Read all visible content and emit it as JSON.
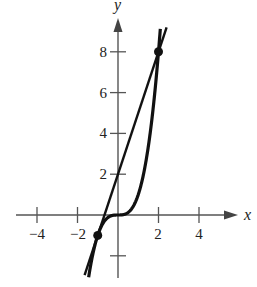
{
  "chart_data": {
    "type": "line",
    "title": "",
    "xlabel": "x",
    "ylabel": "y",
    "xlim": [
      -5,
      5.8
    ],
    "ylim": [
      -3.5,
      10.5
    ],
    "x_ticks": [
      -4,
      -2,
      2,
      4
    ],
    "x_tick_labels": [
      "−4",
      "−2",
      "2",
      "4"
    ],
    "y_ticks": [
      -2,
      2,
      4,
      6,
      8
    ],
    "y_tick_labels": [
      "",
      "2",
      "4",
      "6",
      "8"
    ],
    "grid": false,
    "legend": null,
    "series": [
      {
        "name": "f(x) = x^3",
        "kind": "curve",
        "x": [
          -1.45,
          -1.25,
          -1,
          -0.75,
          -0.5,
          -0.25,
          0,
          0.25,
          0.5,
          0.75,
          1,
          1.25,
          1.5,
          1.75,
          2,
          2.1
        ],
        "y": [
          -3.05,
          -1.95,
          -1,
          -0.42,
          -0.125,
          -0.016,
          0,
          0.016,
          0.125,
          0.42,
          1,
          1.95,
          3.375,
          5.36,
          8,
          9.26
        ]
      },
      {
        "name": "y = 3x + 2",
        "kind": "line",
        "x": [
          -1.65,
          2.4
        ],
        "y": [
          -2.95,
          9.2
        ]
      }
    ],
    "points": [
      {
        "x": -1,
        "y": -1,
        "label": "(-1, -1)"
      },
      {
        "x": 2,
        "y": 8,
        "label": "(2, 8)"
      }
    ]
  },
  "labels": {
    "x_axis": "x",
    "y_axis": "y",
    "x_ticks": [
      "−4",
      "−2",
      "2",
      "4"
    ],
    "y_ticks": [
      "2",
      "4",
      "6",
      "8"
    ]
  }
}
